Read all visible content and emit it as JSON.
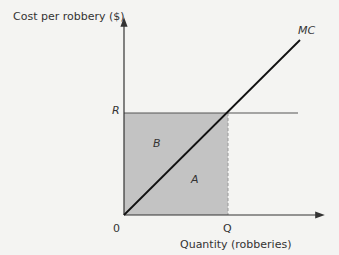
{
  "diagram": {
    "y_axis_label": "Cost per robbery ($)",
    "x_axis_label": "Quantity (robberies)",
    "origin_label": "0",
    "price_label": "R",
    "quantity_label": "Q",
    "curve_label": "MC",
    "area_above_label": "B",
    "area_below_label": "A",
    "colors": {
      "background": "#f4f4f2",
      "shaded_area": "#c3c3c3",
      "axis": "#333333",
      "mc_line": "#111111",
      "r_line": "#555555"
    }
  }
}
